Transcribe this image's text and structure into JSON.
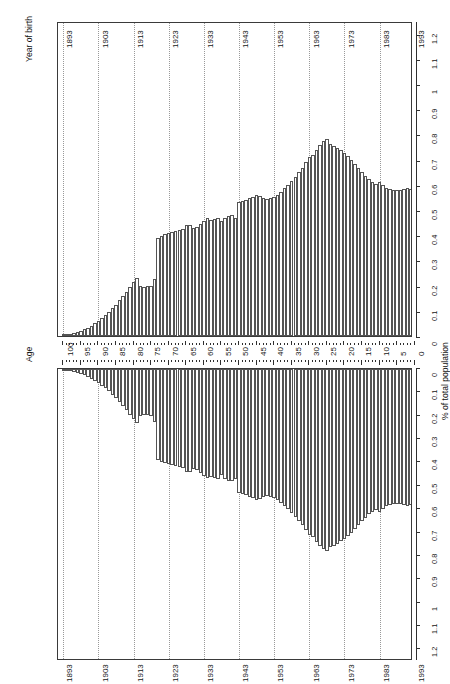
{
  "figure": {
    "type": "population-pyramid",
    "orientation": "rotated-90-ccw",
    "age_axis_title": "Age",
    "year_axis_title": "Year of birth",
    "value_axis_title": "% of total population"
  },
  "axes": {
    "age": {
      "title": "Age",
      "ticks": [
        100,
        95,
        90,
        85,
        80,
        75,
        70,
        65,
        60,
        55,
        50,
        45,
        40,
        35,
        30,
        25,
        20,
        15,
        10,
        5,
        0
      ],
      "min": 0,
      "max": 101
    },
    "year_of_birth": {
      "title": "Year of birth",
      "ticks": [
        1893,
        1903,
        1913,
        1923,
        1933,
        1943,
        1953,
        1963,
        1973,
        1983,
        1993
      ],
      "min": 1892,
      "max": 1993
    },
    "value": {
      "title": "% of total population",
      "ticks": [
        "0",
        "0.1",
        "0.2",
        "0.3",
        "0.4",
        "0.5",
        "0.6",
        "0.7",
        "0.8",
        "0.9",
        "1",
        "1.1",
        "1.2"
      ],
      "min": 0,
      "max": 1.25,
      "step": 0.1
    }
  },
  "chart_data": {
    "type": "bar",
    "title": "",
    "xlabel": "% of total population",
    "ylabel": "Age",
    "ylim": [
      0,
      1.25
    ],
    "legend": [],
    "grid": true,
    "note": "Back-to-back population pyramid. Categories are single-year ages 0-100 (year of birth 1993 down to 1893). Two mirrored panels show the same distribution shape.",
    "categories_age": [
      100,
      99,
      98,
      97,
      96,
      95,
      94,
      93,
      92,
      91,
      90,
      89,
      88,
      87,
      86,
      85,
      84,
      83,
      82,
      81,
      80,
      79,
      78,
      77,
      76,
      75,
      74,
      73,
      72,
      71,
      70,
      69,
      68,
      67,
      66,
      65,
      64,
      63,
      62,
      61,
      60,
      59,
      58,
      57,
      56,
      55,
      54,
      53,
      52,
      51,
      50,
      49,
      48,
      47,
      46,
      45,
      44,
      43,
      42,
      41,
      40,
      39,
      38,
      37,
      36,
      35,
      34,
      33,
      32,
      31,
      30,
      29,
      28,
      27,
      26,
      25,
      24,
      23,
      22,
      21,
      20,
      19,
      18,
      17,
      16,
      15,
      14,
      13,
      12,
      11,
      10,
      9,
      8,
      7,
      6,
      5,
      4,
      3,
      2,
      1,
      0
    ],
    "categories_year": [
      1893,
      1894,
      1895,
      1896,
      1897,
      1898,
      1899,
      1900,
      1901,
      1902,
      1903,
      1904,
      1905,
      1906,
      1907,
      1908,
      1909,
      1910,
      1911,
      1912,
      1913,
      1914,
      1915,
      1916,
      1917,
      1918,
      1919,
      1920,
      1921,
      1922,
      1923,
      1924,
      1925,
      1926,
      1927,
      1928,
      1929,
      1930,
      1931,
      1932,
      1933,
      1934,
      1935,
      1936,
      1937,
      1938,
      1939,
      1940,
      1941,
      1942,
      1943,
      1944,
      1945,
      1946,
      1947,
      1948,
      1949,
      1950,
      1951,
      1952,
      1953,
      1954,
      1955,
      1956,
      1957,
      1958,
      1959,
      1960,
      1961,
      1962,
      1963,
      1964,
      1965,
      1966,
      1967,
      1968,
      1969,
      1970,
      1971,
      1972,
      1973,
      1974,
      1975,
      1976,
      1977,
      1978,
      1979,
      1980,
      1981,
      1982,
      1983,
      1984,
      1985,
      1986,
      1987,
      1988,
      1989,
      1990,
      1991,
      1992,
      1993
    ],
    "series": [
      {
        "name": "panel-A",
        "values": [
          0.004,
          0.006,
          0.008,
          0.011,
          0.015,
          0.02,
          0.026,
          0.033,
          0.041,
          0.05,
          0.06,
          0.071,
          0.083,
          0.096,
          0.11,
          0.125,
          0.141,
          0.158,
          0.176,
          0.195,
          0.215,
          0.232,
          0.2,
          0.196,
          0.197,
          0.2,
          0.225,
          0.39,
          0.398,
          0.404,
          0.408,
          0.412,
          0.415,
          0.42,
          0.424,
          0.44,
          0.442,
          0.43,
          0.434,
          0.444,
          0.456,
          0.468,
          0.462,
          0.466,
          0.47,
          0.455,
          0.47,
          0.478,
          0.48,
          0.47,
          0.53,
          0.536,
          0.54,
          0.546,
          0.552,
          0.56,
          0.555,
          0.548,
          0.545,
          0.546,
          0.552,
          0.56,
          0.572,
          0.586,
          0.6,
          0.616,
          0.632,
          0.65,
          0.668,
          0.69,
          0.712,
          0.72,
          0.74,
          0.757,
          0.772,
          0.78,
          0.762,
          0.756,
          0.748,
          0.738,
          0.728,
          0.716,
          0.7,
          0.684,
          0.668,
          0.652,
          0.636,
          0.622,
          0.612,
          0.604,
          0.612,
          0.6,
          0.588,
          0.584,
          0.58,
          0.578,
          0.58,
          0.582,
          0.586,
          0.584,
          0.576
        ]
      },
      {
        "name": "panel-B",
        "values": [
          0.004,
          0.006,
          0.008,
          0.011,
          0.015,
          0.02,
          0.026,
          0.033,
          0.041,
          0.05,
          0.06,
          0.071,
          0.083,
          0.096,
          0.11,
          0.125,
          0.141,
          0.158,
          0.176,
          0.195,
          0.215,
          0.232,
          0.2,
          0.196,
          0.197,
          0.2,
          0.225,
          0.39,
          0.398,
          0.404,
          0.408,
          0.412,
          0.415,
          0.42,
          0.424,
          0.44,
          0.442,
          0.43,
          0.434,
          0.444,
          0.456,
          0.468,
          0.462,
          0.466,
          0.47,
          0.455,
          0.47,
          0.478,
          0.48,
          0.47,
          0.53,
          0.536,
          0.54,
          0.546,
          0.552,
          0.56,
          0.555,
          0.548,
          0.545,
          0.546,
          0.552,
          0.56,
          0.572,
          0.586,
          0.6,
          0.616,
          0.632,
          0.65,
          0.668,
          0.69,
          0.712,
          0.72,
          0.74,
          0.757,
          0.772,
          0.78,
          0.762,
          0.756,
          0.748,
          0.738,
          0.728,
          0.716,
          0.7,
          0.684,
          0.668,
          0.652,
          0.636,
          0.622,
          0.612,
          0.604,
          0.612,
          0.6,
          0.588,
          0.584,
          0.58,
          0.578,
          0.58,
          0.582,
          0.586,
          0.584,
          0.576
        ]
      }
    ]
  }
}
